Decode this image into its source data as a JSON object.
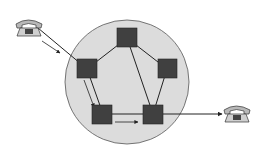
{
  "diagram": {
    "colors": {
      "network": "#dcdcdc",
      "network_border": "#555555",
      "node": "#404040",
      "link": "#222222",
      "phone": "#b8b8b8"
    },
    "network_cloud": {
      "cx": 127,
      "cy": 82,
      "r": 62
    },
    "nodes": [
      {
        "id": "A",
        "x": 87,
        "y": 69
      },
      {
        "id": "B",
        "x": 127,
        "y": 38
      },
      {
        "id": "C",
        "x": 167,
        "y": 69
      },
      {
        "id": "D",
        "x": 103,
        "y": 114
      },
      {
        "id": "E",
        "x": 153,
        "y": 114
      }
    ],
    "links": [
      [
        "A",
        "B"
      ],
      [
        "B",
        "C"
      ],
      [
        "A",
        "D"
      ],
      [
        "D",
        "E"
      ],
      [
        "B",
        "E"
      ],
      [
        "C",
        "E"
      ]
    ],
    "endpoints": [
      {
        "id": "caller-phone",
        "x": 20,
        "y": 26
      },
      {
        "id": "callee-phone",
        "x": 236,
        "y": 113
      }
    ],
    "path": [
      "caller-phone",
      "A",
      "D",
      "E",
      "callee-phone"
    ]
  }
}
